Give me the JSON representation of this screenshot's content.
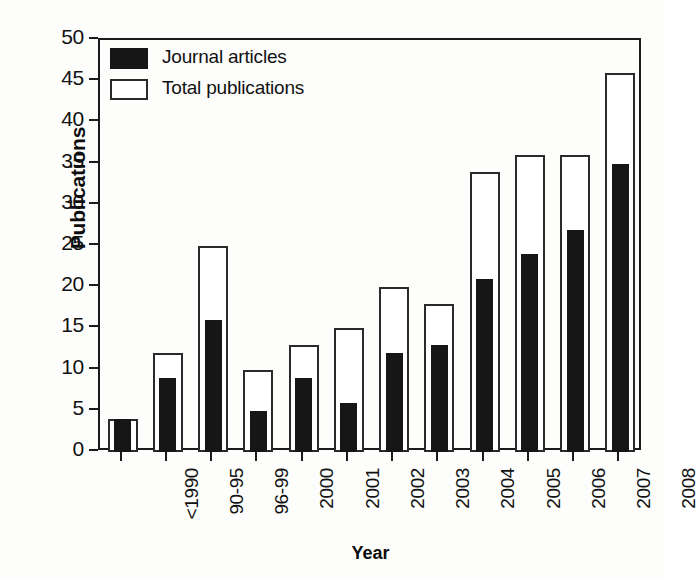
{
  "chart_data": {
    "type": "bar",
    "title": "",
    "xlabel": "Year",
    "ylabel": "Publications",
    "categories": [
      "<1990",
      "90-95",
      "96-99",
      "2000",
      "2001",
      "2002",
      "2003",
      "2004",
      "2005",
      "2006",
      "2007",
      "2008"
    ],
    "series": [
      {
        "name": "Journal articles",
        "color": "#161616",
        "style": "filled",
        "values": [
          4,
          9,
          16,
          5,
          9,
          6,
          12,
          13,
          21,
          24,
          27,
          35
        ]
      },
      {
        "name": "Total publications",
        "color": "#ffffff",
        "style": "hollow",
        "values": [
          4,
          12,
          25,
          10,
          13,
          15,
          20,
          18,
          34,
          36,
          36,
          46
        ]
      }
    ],
    "ylim": [
      0,
      50
    ],
    "ytick_step": 5,
    "yticks": [
      "0",
      "5",
      "10",
      "15",
      "20",
      "25",
      "30",
      "35",
      "40",
      "45",
      "50"
    ],
    "grid": false,
    "legend_position": "top-left",
    "legend_entries": [
      "Journal articles",
      "Total publications"
    ],
    "axis_color": "#1b1b1b",
    "background": "#fdfdfc"
  }
}
